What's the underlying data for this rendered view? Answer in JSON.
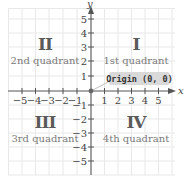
{
  "diagram": {
    "axes": {
      "x_label": "x",
      "y_label": "y",
      "x_ticks_negative": [
        "−5",
        "−4",
        "−3",
        "−2",
        "−1"
      ],
      "x_ticks_positive": [
        "1",
        "2",
        "3",
        "4",
        "5"
      ],
      "y_ticks_positive": [
        "5",
        "4",
        "3",
        "2",
        "1"
      ],
      "y_ticks_negative": [
        "−1",
        "−2",
        "−3",
        "−4",
        "−5"
      ],
      "range": [
        -5,
        5
      ]
    },
    "quadrants": [
      {
        "numeral": "I",
        "label": "1st quadrant"
      },
      {
        "numeral": "II",
        "label": "2nd quadrant"
      },
      {
        "numeral": "III",
        "label": "3rd quadrant"
      },
      {
        "numeral": "IV",
        "label": "4th quadrant"
      }
    ],
    "origin_callout": "Origin (0, 0)",
    "colors": {
      "grid": "#e6e6e6",
      "axis": "#555555",
      "numeral": "#5a5a5a",
      "callout_bg": "#d9d9d9",
      "origin_dot": "#666666"
    }
  }
}
